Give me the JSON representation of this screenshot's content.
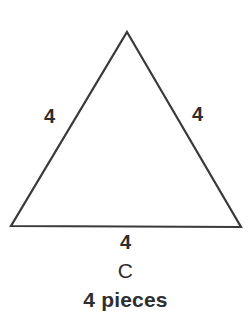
{
  "figure": {
    "type": "geometry-diagram",
    "background_color": "#ffffff",
    "stroke_color": "#3a3a3a",
    "text_color": "#2e2e2e",
    "shape": {
      "name": "triangle",
      "kind": "equilateral",
      "vertices": [
        {
          "id": "apex",
          "x": 127,
          "y": 32
        },
        {
          "id": "bottom-left",
          "x": 11,
          "y": 226
        },
        {
          "id": "bottom-right",
          "x": 241,
          "y": 227
        }
      ]
    },
    "side_labels": {
      "left": "4",
      "right": "4",
      "base": "4"
    },
    "caption": {
      "shape_letter": "C",
      "pieces_text": "4 pieces"
    }
  }
}
